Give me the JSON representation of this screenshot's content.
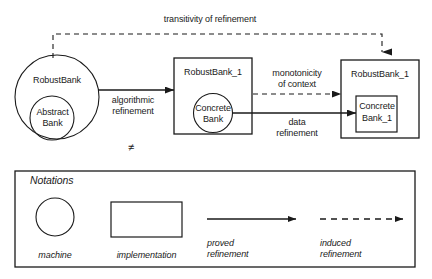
{
  "figure": {
    "cropped_header_text": "a partial line of text clipped at the top edge",
    "top_label": "transitivity of refinement",
    "not_equal_symbol": "≠"
  },
  "nodes": {
    "left_machine": {
      "outer_label": "RobustBank",
      "inner_label_line1": "Abstract",
      "inner_label_line2": "Bank"
    },
    "middle_implementation": {
      "outer_label": "RobustBank_1",
      "inner_label_line1": "Concrete",
      "inner_label_line2": "Bank"
    },
    "right_implementation": {
      "outer_label": "RobustBank_1",
      "inner_label_line1": "Concrete",
      "inner_label_line2": "Bank_1"
    }
  },
  "edges": {
    "algorithmic": {
      "line1": "algorithmic",
      "line2": "refinement"
    },
    "monotonicity": {
      "line1": "monotonicity",
      "line2": "of context"
    },
    "data": {
      "line1": "data",
      "line2": "refinement"
    }
  },
  "notations": {
    "title": "Notations",
    "items": [
      {
        "label": "machine",
        "glyph": "circle-shape"
      },
      {
        "label": "implementation",
        "glyph": "rectangle-shape"
      },
      {
        "label_line1": "proved",
        "label_line2": "refinement",
        "glyph": "solid-arrow"
      },
      {
        "label_line1": "induced",
        "label_line2": "refinement",
        "glyph": "dashed-arrow"
      }
    ]
  },
  "colors": {
    "stroke": "#1a1a1a",
    "text": "#1a1a1a",
    "background": "#ffffff"
  }
}
